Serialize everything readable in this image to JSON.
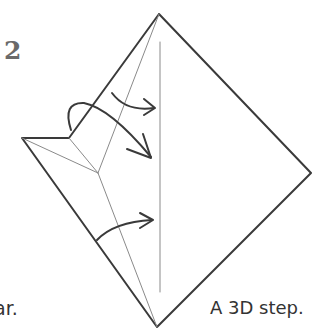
{
  "diagram": {
    "step_number": "2",
    "caption_left": "ar.",
    "caption_right": "A 3D step.",
    "colors": {
      "line": "#3a3a3a",
      "thin": "#8a8a8a",
      "text": "#333333",
      "step": "#6a6a6a"
    },
    "arrows": [
      {
        "label": "upper-arrow",
        "direction": "right"
      },
      {
        "label": "middle-arrow",
        "direction": "down-right"
      },
      {
        "label": "lower-arrow",
        "direction": "right"
      }
    ]
  }
}
